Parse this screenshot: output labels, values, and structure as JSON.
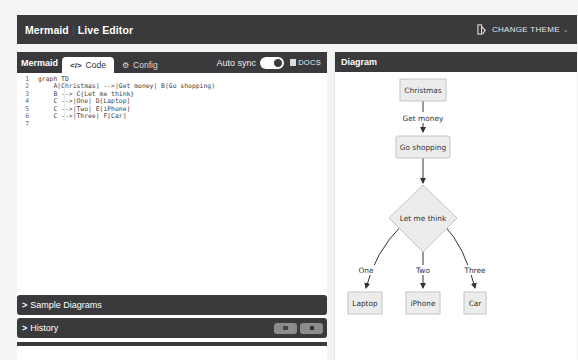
{
  "navbar": {
    "brand": "Mermaid",
    "separator": "|",
    "title": "Live Editor",
    "change_theme_label": "CHANGE THEME"
  },
  "editor": {
    "title": "Mermaid",
    "tabs": [
      {
        "label": "Code",
        "icon": "code-icon",
        "active": true
      },
      {
        "label": "Config",
        "icon": "gear-icon",
        "active": false
      }
    ],
    "auto_sync_label": "Auto sync",
    "auto_sync_on": true,
    "docs_label": "DOCS",
    "lines": [
      {
        "num": "1",
        "text": "graph TD"
      },
      {
        "num": "2",
        "text": "    A[Christmas] -->|Get money| B(Go shopping)"
      },
      {
        "num": "3",
        "text": "    B --> C{Let me think}"
      },
      {
        "num": "4",
        "text": "    C -->|One| D[Laptop]"
      },
      {
        "num": "5",
        "text": "    C -->|Two| E[iPhone]"
      },
      {
        "num": "6",
        "text": "    C -->|Three| F[Car]"
      },
      {
        "num": "7",
        "text": ""
      }
    ]
  },
  "panels": {
    "sample_diagrams_label": "Sample Diagrams",
    "history_label": "History"
  },
  "diagram": {
    "title": "Diagram",
    "nodes": {
      "A": "Christmas",
      "B": "Go shopping",
      "C": "Let me think",
      "D": "Laptop",
      "E": "iPhone",
      "F": "Car"
    },
    "edges": {
      "AB": "Get money",
      "CD": "One",
      "CE": "Two",
      "CF": "Three"
    },
    "colors": {
      "node_fill": "#ececec",
      "node_stroke": "#c4c4c4",
      "edge": "#333333"
    }
  }
}
